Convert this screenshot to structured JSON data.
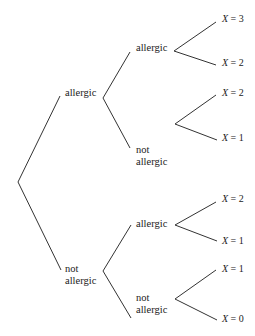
{
  "diagram": {
    "type": "probability-tree",
    "edge_color": "#333333",
    "levels": [
      {
        "level": 1,
        "nodes": [
          {
            "id": "A",
            "label_lines": [
              "allergic"
            ]
          },
          {
            "id": "N",
            "label_lines": [
              "not",
              "allergic"
            ]
          }
        ]
      },
      {
        "level": 2,
        "nodes": [
          {
            "id": "AA",
            "parent": "A",
            "label_lines": [
              "allergic"
            ]
          },
          {
            "id": "AN",
            "parent": "A",
            "label_lines": [
              "not",
              "allergic"
            ]
          },
          {
            "id": "NA",
            "parent": "N",
            "label_lines": [
              "allergic"
            ]
          },
          {
            "id": "NN",
            "parent": "N",
            "label_lines": [
              "not",
              "allergic"
            ]
          }
        ]
      }
    ],
    "outcomes": [
      {
        "parent": "AA",
        "var": "X",
        "eq": " = ",
        "value": "3"
      },
      {
        "parent": "AA",
        "var": "X",
        "eq": " = ",
        "value": "2"
      },
      {
        "parent": "AN",
        "var": "X",
        "eq": " = ",
        "value": "2"
      },
      {
        "parent": "AN",
        "var": "X",
        "eq": " = ",
        "value": "1"
      },
      {
        "parent": "NA",
        "var": "X",
        "eq": " = ",
        "value": "2"
      },
      {
        "parent": "NA",
        "var": "X",
        "eq": " = ",
        "value": "1"
      },
      {
        "parent": "NN",
        "var": "X",
        "eq": " = ",
        "value": "1"
      },
      {
        "parent": "NN",
        "var": "X",
        "eq": " = ",
        "value": "0"
      }
    ]
  }
}
